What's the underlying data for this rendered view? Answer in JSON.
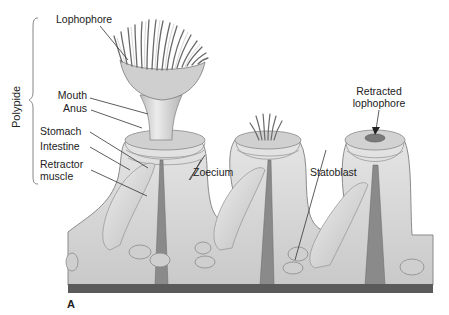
{
  "figure": {
    "panel_label": "A",
    "group_label": "Polypide",
    "labels": {
      "lophophore": "Lophophore",
      "mouth": "Mouth",
      "anus": "Anus",
      "stomach": "Stomach",
      "intestine": "Intestine",
      "retractor_line1": "Retractor",
      "retractor_line2": "muscle",
      "zoecium": "Zoecium",
      "statoblast": "Statoblast",
      "retracted_line1": "Retracted",
      "retracted_line2": "lophophore"
    },
    "colors": {
      "body_fill": "#d8d8d8",
      "body_shade": "#b9b9b9",
      "base_bar": "#5a5a5a",
      "line": "#333333"
    }
  }
}
